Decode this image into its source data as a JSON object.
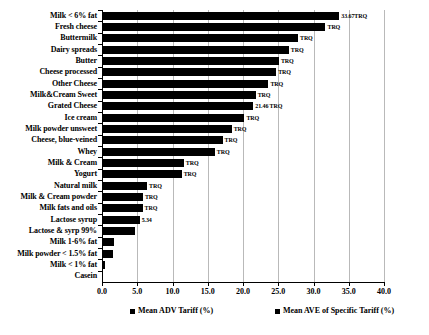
{
  "chart_data": {
    "type": "bar",
    "orientation": "horizontal",
    "title": "",
    "xlabel": "",
    "ylabel": "",
    "xlim": [
      0.0,
      40.0
    ],
    "xticks": [
      "0.0",
      "5.0",
      "10.0",
      "15.0",
      "20.0",
      "25.0",
      "30.0",
      "35.0",
      "40.0"
    ],
    "grid": true,
    "grid_axis": "x",
    "legend_position": "bottom",
    "series": [
      {
        "name": "Mean ADV Tariff (%)",
        "color": "#000000",
        "categories": [
          "Milk < 6% fat",
          "Fresh cheese",
          "Buttermilk",
          "Dairy spreads",
          "Butter",
          "Cheese processed",
          "Other Cheese",
          "Milk&Cream Sweet",
          "Grated Cheese",
          "Ice cream",
          "Milk powder unsweet",
          "Cheese, blue-veined",
          "Whey",
          "Milk & Cream",
          "Yogurt",
          "Natural milk",
          "Milk & Cream powder",
          "Milk fats and oils",
          "Lactose syrup",
          "Lactose & syrp 99%",
          "Milk 1-6% fat",
          "Milk powder < 1.5% fat",
          "Milk < 1% fat",
          "Casein"
        ],
        "values": [
          33.67,
          31.7,
          27.8,
          26.5,
          25.1,
          24.7,
          23.6,
          21.8,
          21.46,
          20.2,
          18.4,
          17.1,
          16.0,
          11.6,
          11.3,
          6.4,
          5.8,
          5.75,
          5.34,
          4.7,
          1.75,
          1.6,
          0.45,
          0.0
        ],
        "annotations": [
          "33.67TRQ",
          "TRQ",
          "TRQ",
          "TRQ",
          "TRQ",
          "TRQ",
          "TRQ",
          "TRQ",
          "21.46 TRQ",
          "TRQ",
          "TRQ",
          "TRQ",
          "TRQ",
          "TRQ",
          "TRQ",
          "TRQ",
          "TRQ",
          "TRQ",
          "5.34",
          "",
          "",
          "",
          "",
          ""
        ]
      }
    ],
    "legend": [
      {
        "label": "Mean ADV Tariff (%)",
        "color": "#000000"
      },
      {
        "label": "Mean AVE of Specific Tariff (%)",
        "color": "#000000"
      }
    ]
  }
}
